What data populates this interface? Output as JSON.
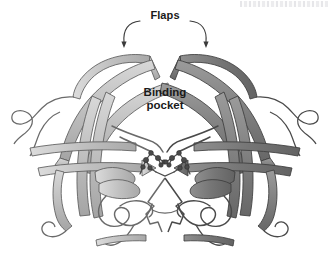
{
  "figure": {
    "background": "#ffffff",
    "artifact_label": "scan-artifact-top-right"
  },
  "labels": {
    "flaps": "Flaps",
    "binding_pocket": "Binding\npocket"
  },
  "colors": {
    "chain_a_fill": "#b9b9b9",
    "chain_a_fill_light": "#d2d2d2",
    "chain_a_edge": "#5c5c5c",
    "chain_b_fill": "#7f7f7f",
    "chain_b_fill_light": "#9a9a9a",
    "chain_b_edge": "#3d3d3d",
    "loop_stroke": "#6a6a6a",
    "atom_fill": "#4a4a4a",
    "text": "#1a1a1a",
    "annotation": "#3a3a3a"
  },
  "annotations": {
    "leader_arrows": 2,
    "arrow_targets": [
      "left-flap-tip",
      "right-flap-tip"
    ]
  },
  "structure": {
    "chains": [
      {
        "id": "A",
        "name": "chain-a-light",
        "shade": "light"
      },
      {
        "id": "B",
        "name": "chain-b-dark",
        "shade": "dark"
      }
    ],
    "features": [
      "beta-sheet-arrow-ribbons",
      "flap-hairpin-loops",
      "catalytic-aspartate-residues",
      "alpha-helix-turn",
      "terminal-beta-strands"
    ],
    "active_site_atoms": 14
  }
}
